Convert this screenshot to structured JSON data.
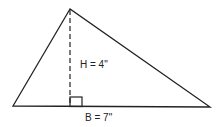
{
  "diagram": {
    "type": "triangle-area",
    "vertices": {
      "apex": [
        70,
        9
      ],
      "bottom_left": [
        13,
        106
      ],
      "bottom_right": [
        210,
        107
      ]
    },
    "height_line": {
      "x": 70,
      "y1": 10,
      "y2": 106,
      "style": "dashed"
    },
    "right_angle_marker": {
      "x": 70,
      "y": 98,
      "size": 12
    },
    "labels": {
      "height": "H = 4\"",
      "base": "B = 7\""
    },
    "colors": {
      "stroke": "#222222",
      "background": "#ffffff"
    }
  }
}
